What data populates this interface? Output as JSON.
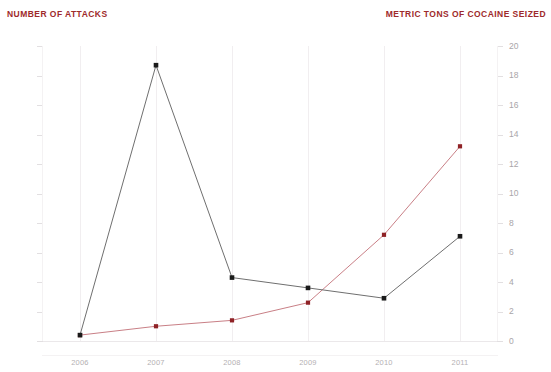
{
  "chart_data": {
    "type": "line",
    "title": "",
    "xlabel": "",
    "categories": [
      "2006",
      "2007",
      "2008",
      "2009",
      "2010",
      "2011"
    ],
    "grid": "vertical",
    "legend": "none",
    "series": [
      {
        "name": "NUMBER OF ATTACKS",
        "axis": "left",
        "color": "#1a1a1a",
        "line_color": "#6f6f6f",
        "values": [
          20,
          935,
          215,
          180,
          145,
          355
        ]
      },
      {
        "name": "METRIC TONS OF COCAINE SEIZED",
        "axis": "right",
        "color": "#8f2226",
        "line_color": "#c97f86",
        "values": [
          0.4,
          1.0,
          1.4,
          2.6,
          7.2,
          13.2
        ]
      }
    ],
    "left_axis": {
      "label": "NUMBER OF ATTACKS",
      "ylim": [
        0,
        1000
      ],
      "ticks": [
        "0",
        "100",
        "200",
        "300",
        "400",
        "500",
        "600",
        "700",
        "800",
        "900",
        "1,000"
      ],
      "color": "#9e2a2b"
    },
    "right_axis": {
      "label": "METRIC TONS OF COCAINE SEIZED",
      "ylim": [
        0,
        20
      ],
      "ticks": [
        "0",
        "2",
        "4",
        "6",
        "8",
        "10",
        "12",
        "14",
        "16",
        "18",
        "20"
      ],
      "color": "#9e2a2b"
    }
  }
}
